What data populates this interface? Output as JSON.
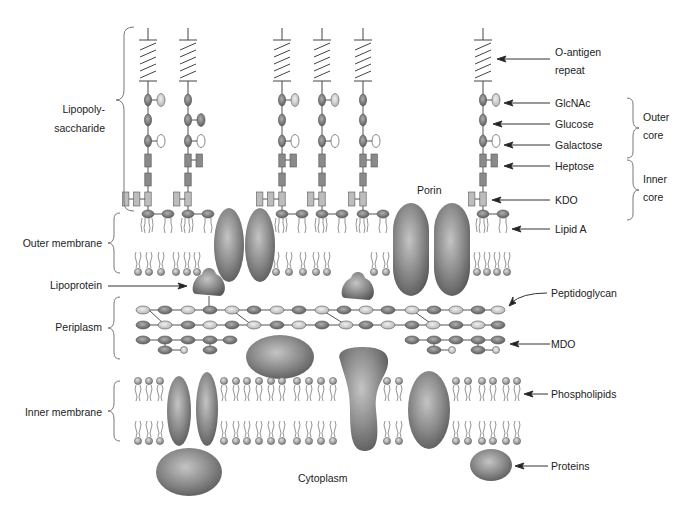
{
  "diagram": {
    "colors": {
      "background": "#ffffff",
      "protein_dark": "#6f6f6f",
      "protein_light": "#bdbdbd",
      "sugar_dark": "#7a7a7a",
      "sugar_light": "#d6d6d6",
      "line": "#555555",
      "label": "#222222"
    },
    "left_labels": {
      "lipopolysaccharide_line1": "Lipopoly-",
      "lipopolysaccharide_line2": "saccharide",
      "outer_membrane": "Outer membrane",
      "lipoprotein": "Lipoprotein",
      "periplasm": "Periplasm",
      "inner_membrane": "Inner membrane"
    },
    "right_labels": {
      "o_antigen_line1": "O-antigen",
      "o_antigen_line2": "repeat",
      "glcnac": "GlcNAc",
      "glucose": "Glucose",
      "galactose": "Galactose",
      "heptose": "Heptose",
      "kdo": "KDO",
      "lipid_a": "Lipid A",
      "peptidoglycan": "Peptidoglycan",
      "mdo": "MDO",
      "phospholipids": "Phospholipids",
      "proteins": "Proteins",
      "outer_core_line1": "Outer",
      "outer_core_line2": "core",
      "inner_core_line1": "Inner",
      "inner_core_line2": "core"
    },
    "center_labels": {
      "porin": "Porin",
      "cytoplasm": "Cytoplasm"
    },
    "structures": {
      "lps_chain_count": 6,
      "outer_membrane_porins": 2,
      "outer_membrane_proteins": 2,
      "peptidoglycan_rows": 2,
      "inner_membrane_proteins": 4,
      "peripheral_proteins": 3
    }
  }
}
